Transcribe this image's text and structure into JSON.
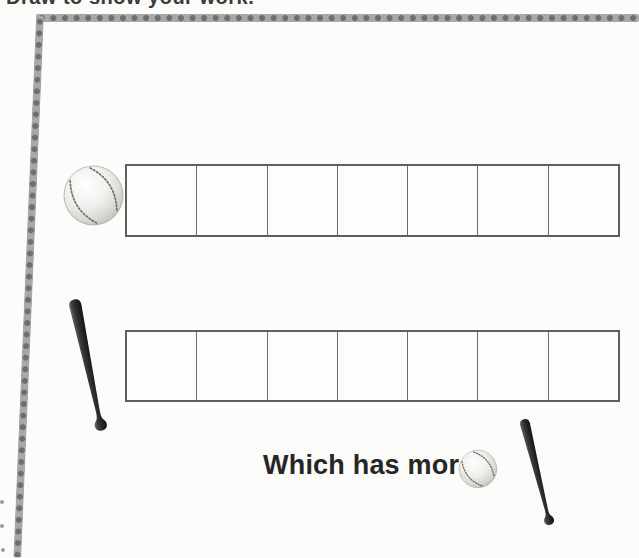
{
  "page": {
    "instruction": "Draw to show your work.",
    "question": "Which has more?"
  },
  "worksheet": {
    "rows": [
      {
        "id": "baseball-row",
        "item": "baseball",
        "cells": 7
      },
      {
        "id": "bat-row",
        "item": "baseball-bat",
        "cells": 7
      }
    ]
  },
  "icons": {
    "left_of_row_1": "baseball-icon",
    "left_of_row_2": "baseball-bat-icon",
    "right_of_question": "baseball-icon",
    "bottom_right": "baseball-bat-icon"
  },
  "colors": {
    "frame_band": "#a8a8a5",
    "frame_dot": "#6e6e6c",
    "grid_line": "#5f5f5d",
    "text": "#262624",
    "bat": "#1d1d1c",
    "ball_shading": "#b9b9b4"
  }
}
